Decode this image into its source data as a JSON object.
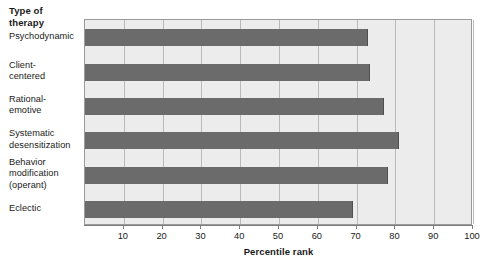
{
  "chart_data": {
    "type": "bar",
    "orientation": "horizontal",
    "title": "",
    "xlabel": "Percentile rank",
    "ylabel": "Type of\ntherapy",
    "ylabel_lines": [
      "Type of",
      "therapy"
    ],
    "categories": [
      "Psychodynamic",
      "Client-centered",
      "Rational-emotive",
      "Systematic desensitization",
      "Behavior modification (operant)",
      "Eclectic"
    ],
    "category_label_lines": [
      [
        "Psychodynamic"
      ],
      [
        "Client-",
        "centered"
      ],
      [
        "Rational-",
        "emotive"
      ],
      [
        "Systematic",
        "desensitization"
      ],
      [
        "Behavior",
        "modification",
        "(operant)"
      ],
      [
        "Eclectic"
      ]
    ],
    "values": [
      73,
      73.5,
      77,
      81,
      78,
      69
    ],
    "xlim": [
      0,
      100
    ],
    "xticks": [
      10,
      20,
      30,
      40,
      50,
      60,
      70,
      80,
      90,
      100
    ],
    "xticklabels": [
      "10",
      "20",
      "30",
      "40",
      "50",
      "60",
      "70",
      "80",
      "90",
      "100"
    ],
    "grid": true,
    "grid_axis": "x",
    "legend": null,
    "colors": {
      "bar": "#6b6b6b",
      "bar_edge": "#4f4f4f",
      "plot_background": "#ececec",
      "plot_border": "#9a9a9a",
      "gridline": "#b9b9b9",
      "axis": "#7d7d7d",
      "text": "#1a1a1a",
      "page_background": "#ffffff"
    }
  }
}
